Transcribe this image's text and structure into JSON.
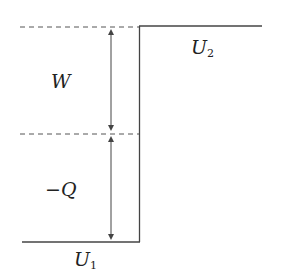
{
  "diagram": {
    "labels": {
      "work": "W",
      "heat": "−Q",
      "u1_main": "U",
      "u1_sub": "1",
      "u2_main": "U",
      "u2_sub": "2"
    },
    "colors": {
      "line": "#444444",
      "dashed": "#555555",
      "text": "#222222"
    }
  }
}
